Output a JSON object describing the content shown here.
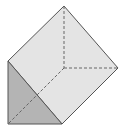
{
  "figure": {
    "shape": "triangular-prism",
    "colors": {
      "background": "#ffffff",
      "top_face": "#e4e4e4",
      "side_face": "#b4b4b4",
      "edge": "#555555",
      "hidden_edge": "#666666"
    },
    "vertices": {
      "top": [
        64,
        6
      ],
      "right": [
        118,
        68
      ],
      "left_top": [
        8,
        61
      ],
      "bottom_left": [
        8,
        124
      ],
      "bottom_right": [
        62,
        124
      ],
      "hidden": [
        64,
        68
      ]
    }
  }
}
